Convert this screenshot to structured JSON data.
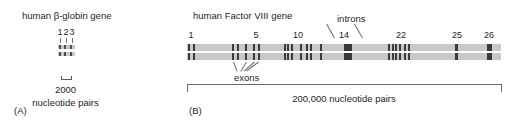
{
  "figure": {
    "panel_a": {
      "letter": "(A)",
      "title": "human β-globin gene",
      "exon_numbers": [
        "1",
        "2",
        "3"
      ],
      "exon_number_x": [
        60,
        66,
        72
      ],
      "strand_left": 58,
      "strand_width": 17,
      "strand_top_1": 45,
      "strand_top_2": 52,
      "exon_x": [
        59,
        64,
        69.5
      ],
      "exon_w": [
        2,
        2,
        2.5
      ],
      "tick_x": [
        60,
        66,
        72
      ],
      "tick_top": 38,
      "scalebar_left": 61,
      "scalebar_width": 9,
      "scalebar_top": 76,
      "scale_value": "2000",
      "scale_unit": "nucleotide pairs"
    },
    "panel_b": {
      "letter": "(B)",
      "title": "human Factor VIII gene",
      "exon_numbers": [
        "1",
        "5",
        "10",
        "14",
        "22",
        "25",
        "26"
      ],
      "exon_number_x": [
        191,
        256,
        298,
        344,
        401,
        457,
        489
      ],
      "introns_label": "introns",
      "introns_label_x": 337,
      "exons_label": "exons",
      "exons_label_x": 234,
      "scale_value": "200,000 nucleotide pairs",
      "exon_bands": [
        {
          "x": 188.0,
          "w": 1.6
        },
        {
          "x": 193.0,
          "w": 2.2
        },
        {
          "x": 232.0,
          "w": 2.0
        },
        {
          "x": 236.5,
          "w": 2.0
        },
        {
          "x": 245.0,
          "w": 2.0
        },
        {
          "x": 253.0,
          "w": 2.0
        },
        {
          "x": 257.5,
          "w": 2.0
        },
        {
          "x": 283.5,
          "w": 2.0
        },
        {
          "x": 287.0,
          "w": 2.0
        },
        {
          "x": 291.0,
          "w": 2.0
        },
        {
          "x": 299.5,
          "w": 2.0
        },
        {
          "x": 306.0,
          "w": 2.0
        },
        {
          "x": 310.0,
          "w": 2.0
        },
        {
          "x": 319.5,
          "w": 2.0
        },
        {
          "x": 344.0,
          "w": 7.5
        },
        {
          "x": 388.0,
          "w": 2.0
        },
        {
          "x": 391.5,
          "w": 2.0
        },
        {
          "x": 395.0,
          "w": 2.0
        },
        {
          "x": 398.5,
          "w": 2.0
        },
        {
          "x": 404.0,
          "w": 2.0
        },
        {
          "x": 407.5,
          "w": 2.0
        },
        {
          "x": 455.0,
          "w": 2.6
        },
        {
          "x": 487.0,
          "w": 4.5
        }
      ],
      "exon_leaders": [
        {
          "x1": 232.5,
          "y1": 62,
          "x2": 236.0,
          "y2": 71
        },
        {
          "x1": 245.5,
          "y1": 62,
          "x2": 240.0,
          "y2": 71
        },
        {
          "x1": 253.5,
          "y1": 62,
          "x2": 243.0,
          "y2": 71
        },
        {
          "x1": 258.0,
          "y1": 62,
          "x2": 246.0,
          "y2": 71
        }
      ],
      "intron_leaders": [
        {
          "x1": 334.0,
          "y1": 38,
          "x2": 326.0,
          "y2": 24
        },
        {
          "x1": 362.0,
          "y1": 38,
          "x2": 354.0,
          "y2": 24
        }
      ]
    },
    "colors": {
      "strand": "#c8c8c8",
      "exon": "#3a3a3a",
      "text": "#231f20",
      "rule": "#6b6b6b",
      "background": "#ffffff"
    }
  }
}
